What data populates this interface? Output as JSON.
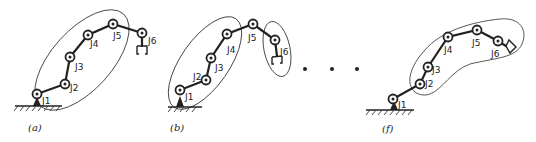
{
  "figure": {
    "panels": [
      {
        "id": "a",
        "caption": "(a)",
        "joints": [
          {
            "label": "J1",
            "x": 37,
            "y": 94
          },
          {
            "label": "J2",
            "x": 65,
            "y": 84
          },
          {
            "label": "J3",
            "x": 70,
            "y": 57
          },
          {
            "label": "J4",
            "x": 88,
            "y": 35
          },
          {
            "label": "J5",
            "x": 113,
            "y": 24
          },
          {
            "label": "J6",
            "x": 142,
            "y": 33
          }
        ],
        "groups": [
          "J1-J5"
        ]
      },
      {
        "id": "b",
        "caption": "(b)",
        "joints": [
          {
            "label": "J1",
            "x": 180,
            "y": 90
          },
          {
            "label": "J2",
            "x": 206,
            "y": 80
          },
          {
            "label": "J3",
            "x": 211,
            "y": 58
          },
          {
            "label": "J4",
            "x": 227,
            "y": 34
          },
          {
            "label": "J5",
            "x": 253,
            "y": 24
          },
          {
            "label": "J6",
            "x": 275,
            "y": 40
          }
        ],
        "groups": [
          "J1-J4",
          "J6"
        ]
      },
      {
        "id": "f",
        "caption": "(f)",
        "joints": [
          {
            "label": "J1",
            "x": 393,
            "y": 99
          },
          {
            "label": "J2",
            "x": 420,
            "y": 84
          },
          {
            "label": "J3",
            "x": 428,
            "y": 67
          },
          {
            "label": "J4",
            "x": 448,
            "y": 37
          },
          {
            "label": "J5",
            "x": 477,
            "y": 30
          },
          {
            "label": "J6",
            "x": 498,
            "y": 41
          }
        ],
        "groups": [
          "J2-J6+gripper"
        ]
      }
    ],
    "ellipsis": "• • •"
  },
  "labels": {
    "a": {
      "j1": "J1",
      "j2": "J2",
      "j3": "J3",
      "j4": "J4",
      "j5": "J5",
      "j6": "J6",
      "caption": "(a)"
    },
    "b": {
      "j1": "J1",
      "j2": "J2",
      "j3": "J3",
      "j4": "J4",
      "j5": "J5",
      "j6": "J6",
      "caption": "(b)"
    },
    "f": {
      "j1": "J1",
      "j2": "J2",
      "j3": "J3",
      "j4": "J4",
      "j5": "J5",
      "j6": "J6",
      "caption": "(f)"
    }
  }
}
